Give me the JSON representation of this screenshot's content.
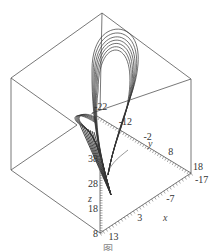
{
  "chart_data": {
    "type": "line",
    "subtype": "3d-phase-trajectory",
    "title": "",
    "caption": "图",
    "axes": {
      "x": {
        "label": "x",
        "ticks": [
          13,
          3,
          -7,
          -17
        ],
        "range": [
          13,
          -17
        ]
      },
      "y": {
        "label": "y",
        "ticks": [
          -22,
          -12,
          -2,
          8,
          18
        ],
        "range": [
          -22,
          18
        ]
      },
      "z": {
        "label": "z",
        "ticks": [
          8,
          18,
          28,
          38
        ],
        "range": [
          8,
          48
        ]
      }
    },
    "box": true,
    "grid": false,
    "legend": "none",
    "series": [
      {
        "name": "trajectory",
        "description": "Chaotic attractor: a multi-turn elongated loop rising high in z, with a small spiral lobe on the left, converging to a narrow tail at low z",
        "loops": [
          {
            "scale": 1.0
          },
          {
            "scale": 0.93
          },
          {
            "scale": 0.86
          },
          {
            "scale": 0.8
          },
          {
            "scale": 0.74
          },
          {
            "scale": 0.68
          },
          {
            "scale": 0.62
          }
        ]
      }
    ],
    "colors": {
      "line": "#333333",
      "box": "#555555"
    }
  }
}
